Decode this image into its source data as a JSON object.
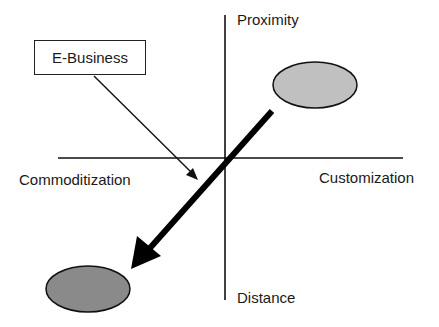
{
  "diagram": {
    "type": "quadrant-strategy-diagram",
    "axes": {
      "vertical": {
        "top_label": "Proximity",
        "bottom_label": "Distance"
      },
      "horizontal": {
        "left_label": "Commoditization",
        "right_label": "Customization"
      }
    },
    "callout": {
      "label": "E-Business"
    },
    "nodes": [
      {
        "id": "start-ellipse",
        "quadrant": "proximity-customization",
        "fill": "#c0c0c0"
      },
      {
        "id": "end-ellipse",
        "quadrant": "distance-commoditization",
        "fill": "#8a8a8a"
      }
    ],
    "arrows": [
      {
        "id": "shift-arrow",
        "from": "start-ellipse",
        "to": "end-ellipse",
        "style": "thick"
      },
      {
        "id": "ebusiness-pointer",
        "from": "callout",
        "to": "shift-arrow",
        "style": "thin"
      }
    ]
  },
  "colors": {
    "line": "#111111",
    "light_ellipse": "#c0c0c0",
    "dark_ellipse": "#8a8a8a",
    "background": "#ffffff"
  }
}
